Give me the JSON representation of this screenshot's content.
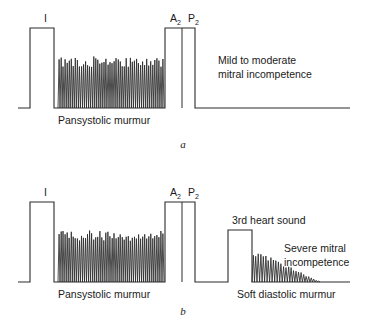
{
  "figure": {
    "width": 368,
    "height": 322,
    "background_color": "#ffffff",
    "trace_color": "#2b2b2b",
    "text_color": "#1a1a1a"
  },
  "panels": [
    {
      "id": "a",
      "panel_letter": "a",
      "panel_letter_pos": {
        "x": 183,
        "y": 148
      },
      "baseline_y": 108,
      "baseline_x_start": 18,
      "baseline_x_end": 350,
      "sounds": [
        {
          "name": "first-heart-sound",
          "label": "I",
          "subscript": "",
          "label_x": 44,
          "label_y": 22,
          "x_start": 30,
          "x_end": 54,
          "top_y": 28
        },
        {
          "name": "aortic-pulmonary-closure",
          "label": "A",
          "subscript": "2",
          "label_x": 170,
          "label_y": 22,
          "x_start": 165,
          "x_end": 195,
          "top_y": 28,
          "divider_x": 182,
          "second_label": "P",
          "second_subscript": "2",
          "second_label_x": 188,
          "second_label_y": 22
        }
      ],
      "murmurs": [
        {
          "name": "pansystolic-murmur",
          "type": "plateau",
          "x_start": 58,
          "x_end": 164,
          "amplitude_start": 51,
          "amplitude_end": 51,
          "spikes": 52
        }
      ],
      "captions": [
        {
          "name": "pansystolic-murmur-caption",
          "text": "Pansystolic murmur",
          "x": 58,
          "y": 124,
          "anchor": "start"
        }
      ],
      "annotations": [
        {
          "name": "diagnosis-annotation",
          "lines": [
            "Mild to moderate",
            "mitral incompetence"
          ],
          "x": 218,
          "y": 64,
          "line_height": 14
        }
      ]
    },
    {
      "id": "b",
      "panel_letter": "b",
      "panel_letter_pos": {
        "x": 183,
        "y": 315
      },
      "baseline_y": 282,
      "baseline_x_start": 18,
      "baseline_x_end": 350,
      "sounds": [
        {
          "name": "first-heart-sound",
          "label": "I",
          "subscript": "",
          "label_x": 44,
          "label_y": 196,
          "x_start": 30,
          "x_end": 54,
          "top_y": 202
        },
        {
          "name": "aortic-pulmonary-closure",
          "label": "A",
          "subscript": "2",
          "label_x": 170,
          "label_y": 196,
          "x_start": 165,
          "x_end": 195,
          "top_y": 202,
          "divider_x": 182,
          "second_label": "P",
          "second_subscript": "2",
          "second_label_x": 188,
          "second_label_y": 196
        },
        {
          "name": "third-heart-sound",
          "label": "",
          "subscript": "",
          "x_start": 228,
          "x_end": 252,
          "top_y": 230
        }
      ],
      "murmurs": [
        {
          "name": "pansystolic-murmur",
          "type": "plateau",
          "x_start": 58,
          "x_end": 164,
          "amplitude_start": 51,
          "amplitude_end": 51,
          "spikes": 52
        },
        {
          "name": "soft-diastolic-murmur",
          "type": "decrescendo",
          "x_start": 252,
          "x_end": 320,
          "amplitude_start": 32,
          "amplitude_end": 1,
          "spikes": 27
        }
      ],
      "captions": [
        {
          "name": "pansystolic-murmur-caption",
          "text": "Pansystolic murmur",
          "x": 58,
          "y": 298,
          "anchor": "start"
        },
        {
          "name": "soft-diastolic-murmur-caption",
          "text": "Soft diastolic murmur",
          "x": 237,
          "y": 298,
          "anchor": "start"
        }
      ],
      "annotations": [
        {
          "name": "third-heart-sound-annotation",
          "lines": [
            "3rd heart sound"
          ],
          "x": 232,
          "y": 224,
          "line_height": 14
        },
        {
          "name": "diagnosis-annotation",
          "lines": [
            "Severe mitral",
            "incompetence"
          ],
          "x": 284,
          "y": 252,
          "line_height": 14
        }
      ]
    }
  ],
  "chart_data": {
    "type": "line",
    "xlabel": "",
    "ylabel": "",
    "series": [
      {
        "name": "panel-a-phonocardiogram",
        "events": [
          {
            "label": "I",
            "kind": "heart-sound",
            "x_start": 30,
            "x_end": 54,
            "amplitude": 80
          },
          {
            "label": "Pansystolic murmur",
            "kind": "murmur-plateau",
            "x_start": 58,
            "x_end": 164,
            "amplitude": 51
          },
          {
            "label": "A2",
            "kind": "heart-sound",
            "x_start": 165,
            "x_end": 182,
            "amplitude": 80
          },
          {
            "label": "P2",
            "kind": "heart-sound",
            "x_start": 182,
            "x_end": 195,
            "amplitude": 80
          }
        ]
      },
      {
        "name": "panel-b-phonocardiogram",
        "events": [
          {
            "label": "I",
            "kind": "heart-sound",
            "x_start": 30,
            "x_end": 54,
            "amplitude": 80
          },
          {
            "label": "Pansystolic murmur",
            "kind": "murmur-plateau",
            "x_start": 58,
            "x_end": 164,
            "amplitude": 51
          },
          {
            "label": "A2",
            "kind": "heart-sound",
            "x_start": 165,
            "x_end": 182,
            "amplitude": 80
          },
          {
            "label": "P2",
            "kind": "heart-sound",
            "x_start": 182,
            "x_end": 195,
            "amplitude": 80
          },
          {
            "label": "3rd heart sound",
            "kind": "heart-sound",
            "x_start": 228,
            "x_end": 252,
            "amplitude": 52
          },
          {
            "label": "Soft diastolic murmur",
            "kind": "murmur-decrescendo",
            "x_start": 252,
            "x_end": 320,
            "amplitude": 32
          }
        ]
      }
    ],
    "legend_position": "none",
    "grid": false
  }
}
